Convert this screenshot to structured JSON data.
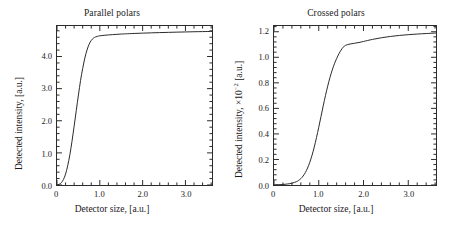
{
  "figure": {
    "background": "#ffffff",
    "line_color": "#2b2b2b"
  },
  "panels": [
    {
      "id": "parallel-polars",
      "title": "Parallel polars",
      "xlabel": "Detector size, [a.u.]",
      "ylabel_main": "Detected intensity, [a.u.]",
      "ylabel_prefix": "Detected intensity, [a.u.]",
      "ylabel_exponent": "",
      "ylabel_suffix": "",
      "xticks": [
        "0",
        "1.0",
        "2.0",
        "3.0"
      ],
      "xtick_values": [
        0,
        1.0,
        2.0,
        3.0
      ],
      "yticks": [
        "0.0",
        "1.0",
        "2.0",
        "3.0",
        "4.0"
      ],
      "ytick_values": [
        0.0,
        1.0,
        2.0,
        3.0,
        4.0
      ]
    },
    {
      "id": "crossed-polars",
      "title": "Crossed polars",
      "xlabel": "Detector size, [a.u.]",
      "ylabel_main": "Detected intensity, ×10⁻² [a.u.]",
      "ylabel_prefix": "Detected intensity, ×10",
      "ylabel_exponent": "−2",
      "ylabel_suffix": " [a.u.]",
      "xticks": [
        "0",
        "1.0",
        "2.0",
        "3.0"
      ],
      "xtick_values": [
        0,
        1.0,
        2.0,
        3.0
      ],
      "yticks": [
        "0.0",
        "0.2",
        "0.4",
        "0.6",
        "0.8",
        "1.0",
        "1.2"
      ],
      "ytick_values": [
        0.0,
        0.2,
        0.4,
        0.6,
        0.8,
        1.0,
        1.2
      ]
    }
  ],
  "chart_data": [
    {
      "type": "line",
      "id": "parallel-polars",
      "title": "Parallel polars",
      "xlabel": "Detector size, [a.u.]",
      "ylabel": "Detected intensity, [a.u.]",
      "xlim": [
        0,
        3.62
      ],
      "ylim": [
        0,
        4.95
      ],
      "grid": false,
      "legend": "none",
      "series": [
        {
          "name": "Detected intensity (parallel polars)",
          "x": [
            0.0,
            0.05,
            0.1,
            0.15,
            0.2,
            0.25,
            0.3,
            0.35,
            0.4,
            0.45,
            0.5,
            0.55,
            0.6,
            0.65,
            0.7,
            0.75,
            0.8,
            0.85,
            0.9,
            0.95,
            1.0,
            1.1,
            1.2,
            1.3,
            1.4,
            1.5,
            1.6,
            1.8,
            2.0,
            2.2,
            2.4,
            2.6,
            2.8,
            3.0,
            3.2,
            3.4,
            3.62
          ],
          "values": [
            0.0,
            0.02,
            0.07,
            0.17,
            0.34,
            0.6,
            0.94,
            1.36,
            1.83,
            2.32,
            2.8,
            3.25,
            3.63,
            3.95,
            4.2,
            4.38,
            4.5,
            4.57,
            4.61,
            4.63,
            4.645,
            4.66,
            4.672,
            4.682,
            4.691,
            4.699,
            4.706,
            4.718,
            4.728,
            4.737,
            4.745,
            4.752,
            4.759,
            4.765,
            4.771,
            4.776,
            4.781
          ]
        }
      ]
    },
    {
      "type": "line",
      "id": "crossed-polars",
      "title": "Crossed polars",
      "xlabel": "Detector size, [a.u.]",
      "ylabel": "Detected intensity, ×10⁻² [a.u.]",
      "xlim": [
        0,
        3.62
      ],
      "ylim": [
        0,
        1.245
      ],
      "grid": false,
      "legend": "none",
      "series": [
        {
          "name": "Detected intensity (crossed polars)",
          "x": [
            0.0,
            0.1,
            0.2,
            0.3,
            0.4,
            0.5,
            0.55,
            0.6,
            0.65,
            0.7,
            0.75,
            0.8,
            0.85,
            0.9,
            0.95,
            1.0,
            1.05,
            1.1,
            1.15,
            1.2,
            1.25,
            1.3,
            1.35,
            1.4,
            1.45,
            1.5,
            1.55,
            1.6,
            1.7,
            1.8,
            1.9,
            2.0,
            2.2,
            2.4,
            2.6,
            2.8,
            3.0,
            3.2,
            3.4,
            3.62
          ],
          "values": [
            0.0,
            0.002,
            0.004,
            0.008,
            0.014,
            0.026,
            0.036,
            0.05,
            0.07,
            0.097,
            0.133,
            0.178,
            0.233,
            0.298,
            0.372,
            0.452,
            0.536,
            0.62,
            0.7,
            0.774,
            0.841,
            0.899,
            0.949,
            0.991,
            1.027,
            1.057,
            1.08,
            1.094,
            1.104,
            1.11,
            1.116,
            1.124,
            1.14,
            1.153,
            1.163,
            1.171,
            1.177,
            1.182,
            1.186,
            1.19
          ]
        }
      ]
    }
  ]
}
